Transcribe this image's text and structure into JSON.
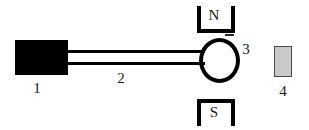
{
  "diagram": {
    "background_color": "#ffffff",
    "ink_color": "#000000",
    "parts": [
      {
        "number": "1",
        "name": "black-block",
        "shape": "filled-rectangle",
        "fill_color": "#000000",
        "label": "1"
      },
      {
        "number": "2",
        "name": "connecting-rod",
        "shape": "double-line-rod",
        "fill_color": "#000000",
        "label": "2"
      },
      {
        "number": "3",
        "name": "coil-circle",
        "shape": "open-circle",
        "stroke_color": "#000000",
        "label": "3"
      },
      {
        "number": "4",
        "name": "gray-slab",
        "shape": "outlined-rectangle",
        "fill_color": "#c9c9c9",
        "stroke_color": "#4a4a4a",
        "label": "4"
      }
    ],
    "magnets": {
      "north": {
        "letter": "N",
        "position": "top",
        "shape": "u-bracket-open-top"
      },
      "south": {
        "letter": "S",
        "position": "bottom",
        "shape": "u-bracket-open-bottom"
      }
    },
    "labels": {
      "one": "1",
      "two": "2",
      "three": "3",
      "four": "4"
    }
  }
}
